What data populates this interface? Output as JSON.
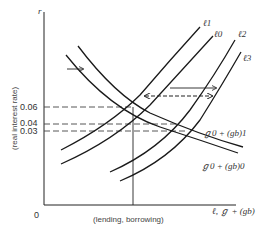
{
  "diagram": {
    "type": "economics-supply-demand",
    "y_axis": {
      "symbol": "r",
      "title": "(real interest rate)",
      "ticks": [
        "0.06",
        "0.04",
        "0.03"
      ],
      "origin": "0"
    },
    "x_axis": {
      "title": "(lending, borrowing)",
      "symbol": "ℓ, ℊ + (gb)"
    },
    "supply_curves": [
      {
        "id": "l1",
        "label": "ℓ1"
      },
      {
        "id": "l0",
        "label": "ℓ0"
      },
      {
        "id": "l2",
        "label": "ℓ2"
      },
      {
        "id": "l3",
        "label": "ℓ3"
      }
    ],
    "demand_curves": [
      {
        "id": "d1",
        "label": "ℊ0 + (gb)1"
      },
      {
        "id": "d0",
        "label": "ℊ0 + (gb)0"
      }
    ],
    "colors": {
      "line": "#1a1a1a",
      "dash": "#555555",
      "text": "#333333"
    }
  }
}
